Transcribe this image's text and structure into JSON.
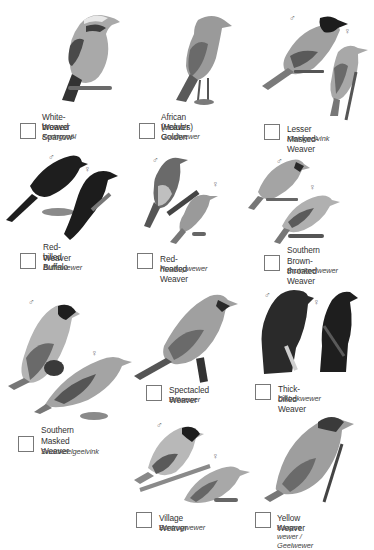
{
  "birds": [
    {
      "name_lines": [
        "White-browed Sparrow-",
        "Weaver"
      ],
      "afrikaans": "Koringvoël",
      "sexes": []
    },
    {
      "name_lines": [
        "African (Holub's) Golden",
        "Weaver"
      ],
      "afrikaans": "Goudwewer",
      "sexes": []
    },
    {
      "name_lines": [
        "Lesser Masked-Weaver"
      ],
      "afrikaans": "Kleingeelvink",
      "sexes": [
        "♂",
        "♀"
      ]
    },
    {
      "name_lines": [
        "Red-billed Buffalo",
        "Weaver"
      ],
      "afrikaans": "Buffelwewer",
      "sexes": [
        "♂",
        "♀"
      ]
    },
    {
      "name_lines": [
        "Red-headed Weaver"
      ],
      "afrikaans": "Rooikopwewer",
      "sexes": [
        "♂",
        "♀"
      ]
    },
    {
      "name_lines": [
        "Southern",
        "Brown-throated Weaver"
      ],
      "afrikaans": "Bruinkeelwewer",
      "sexes": [
        "♂",
        "♀"
      ]
    },
    {
      "name_lines": [
        "Southern",
        "Masked Weaver"
      ],
      "afrikaans": "Swartkeelgeelvink",
      "sexes": [
        "♂",
        "♀"
      ]
    },
    {
      "name_lines": [
        "Spectacled Weaver"
      ],
      "afrikaans": "Brilwewer",
      "sexes": []
    },
    {
      "name_lines": [
        "Thick-billed Weaver"
      ],
      "afrikaans": "Dikbekwewer",
      "sexes": [
        "♂",
        "♀"
      ]
    },
    {
      "name_lines": [
        "Village Weaver"
      ],
      "afrikaans": "Bontrugwewer",
      "sexes": [
        "♂",
        "♀"
      ]
    },
    {
      "name_lines": [
        "Yellow Weaver"
      ],
      "afrikaans": "Kaapse wewer / Geelwewer",
      "sexes": []
    }
  ],
  "colors": {
    "background": "#ffffff",
    "text": "#333333",
    "checkbox_border": "#777777",
    "bird_dark": "#2a2a2a",
    "bird_mid": "#8a8a8a",
    "bird_light": "#c4c4c4"
  }
}
